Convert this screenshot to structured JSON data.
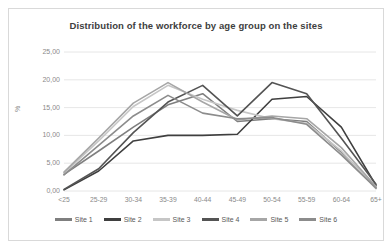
{
  "chart_data": {
    "type": "line",
    "title": "Distribution of the workforce by age group on the sites",
    "xlabel": "",
    "ylabel": "%",
    "ylim": [
      0,
      25
    ],
    "yticks": [
      "0,00",
      "5,00",
      "10,00",
      "15,00",
      "20,00",
      "25,00"
    ],
    "ytick_values": [
      0,
      5,
      10,
      15,
      20,
      25
    ],
    "grid": true,
    "legend_position": "bottom",
    "categories": [
      "<25",
      "25-29",
      "30-34",
      "35-39",
      "40-44",
      "45-49",
      "50-54",
      "55-59",
      "60-64",
      "65+"
    ],
    "series": [
      {
        "name": "Site 1",
        "color": "#7f7f7f",
        "values": [
          3.0,
          7.2,
          11.5,
          15.5,
          17.5,
          12.5,
          13.0,
          12.5,
          7.0,
          0.6
        ]
      },
      {
        "name": "Site 2",
        "color": "#3f3f3f",
        "values": [
          0.2,
          3.6,
          9.0,
          10.0,
          10.0,
          10.2,
          16.5,
          17.0,
          11.5,
          1.0
        ]
      },
      {
        "name": "Site 3",
        "color": "#c6c6c6",
        "values": [
          3.2,
          9.0,
          15.2,
          19.0,
          16.5,
          14.5,
          13.0,
          12.2,
          7.2,
          0.4
        ]
      },
      {
        "name": "Site 4",
        "color": "#545454",
        "values": [
          0.3,
          4.0,
          10.5,
          16.0,
          19.0,
          13.5,
          19.5,
          17.5,
          9.5,
          1.2
        ]
      },
      {
        "name": "Site 5",
        "color": "#a6a6a6",
        "values": [
          3.4,
          9.5,
          15.8,
          19.5,
          16.0,
          12.8,
          13.5,
          13.0,
          7.8,
          0.8
        ]
      },
      {
        "name": "Site 6",
        "color": "#8c8c8c",
        "values": [
          2.9,
          8.2,
          13.5,
          17.2,
          14.0,
          13.0,
          13.2,
          12.0,
          6.5,
          0.5
        ]
      }
    ]
  },
  "chart": {
    "title": "Distribution of the workforce by age group on the sites",
    "y_axis_label": "%"
  }
}
